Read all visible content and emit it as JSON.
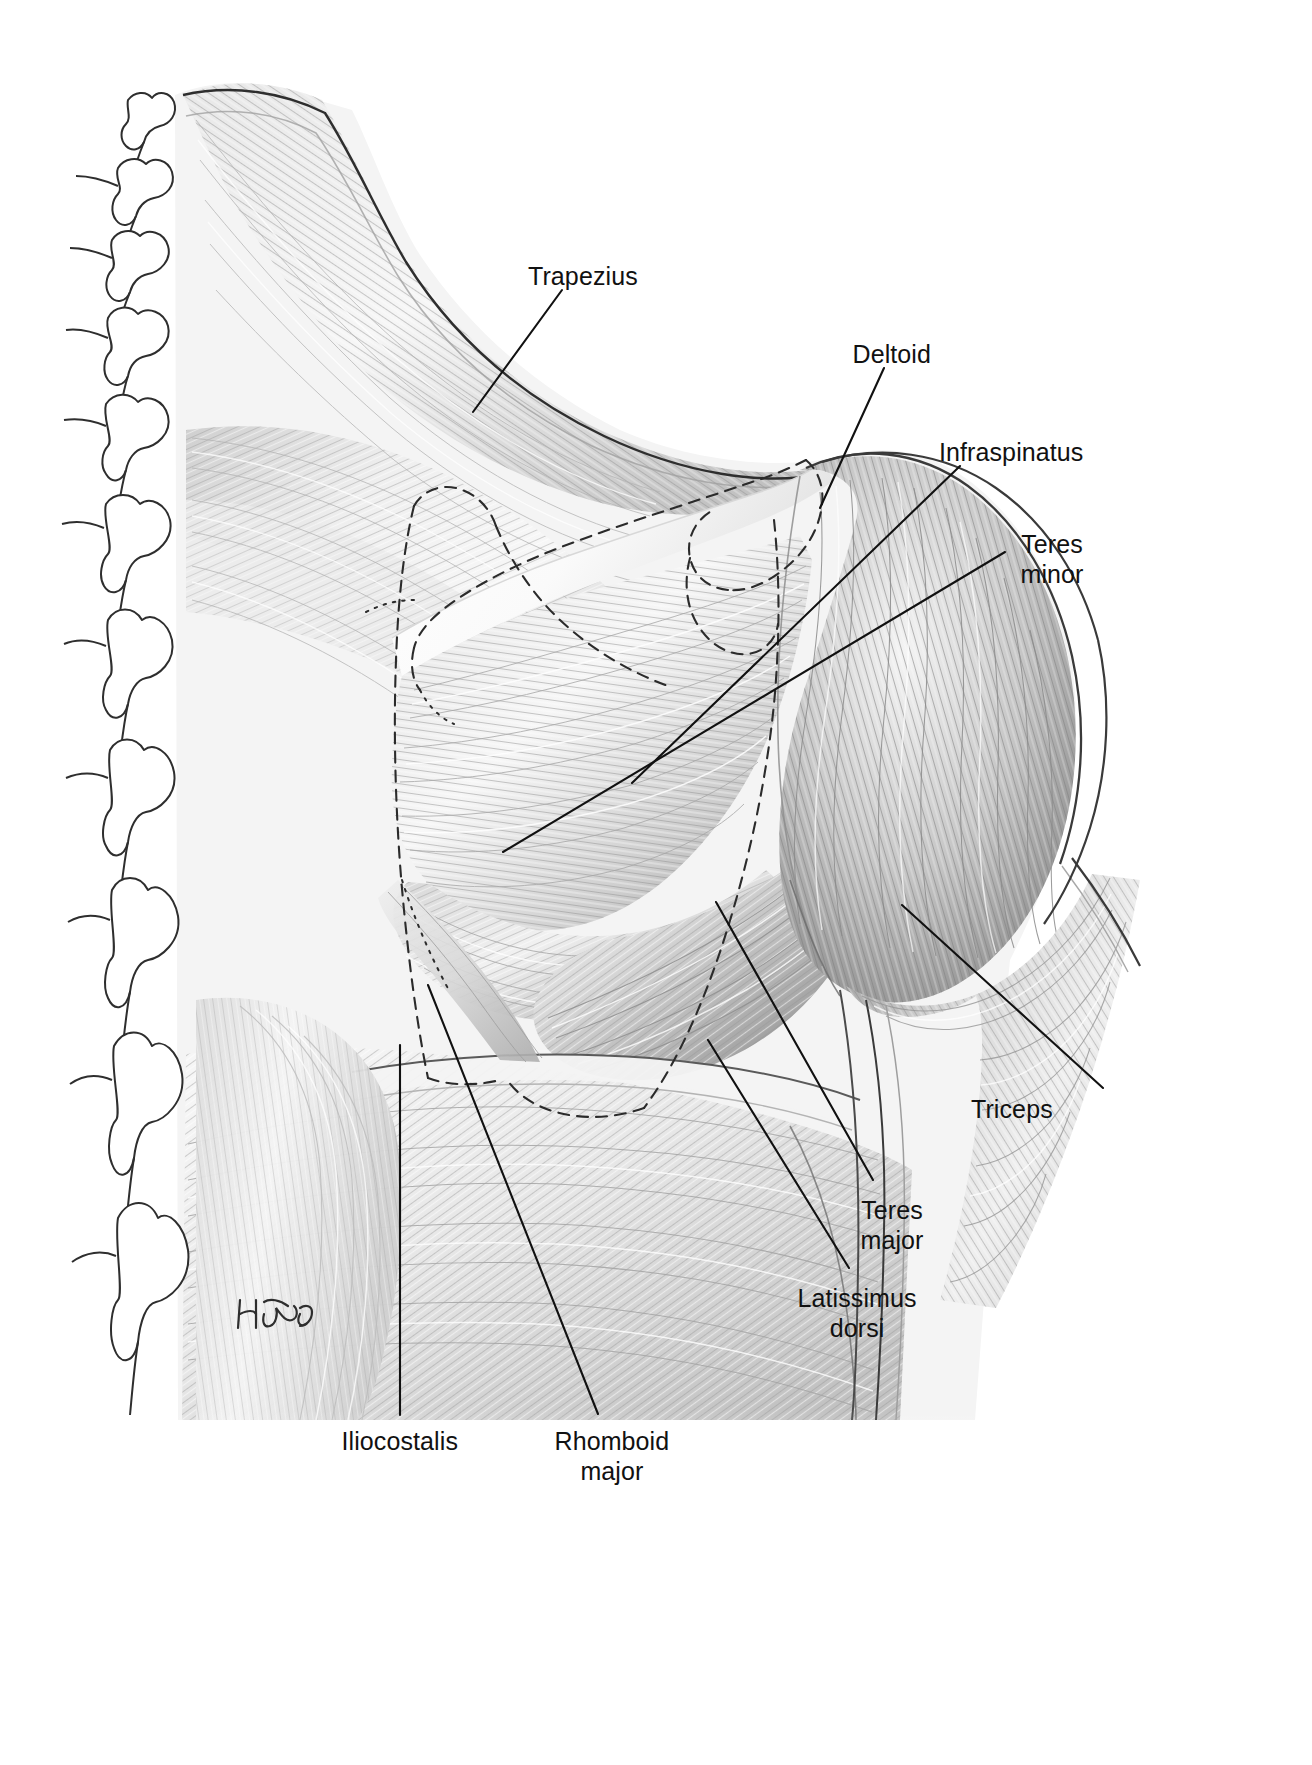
{
  "figure": {
    "artist_signature": "H.Thomas",
    "background_color": "#ffffff",
    "line_color": "#111111",
    "muscle_tone_light": "#f2f2f2",
    "muscle_tone_mid": "#c9c9c9",
    "muscle_tone_dark": "#8d8d8d",
    "muscle_tone_deepest": "#6a6a6a"
  },
  "labels": [
    {
      "id": "trapezius",
      "text": "Trapezius",
      "lines": [
        "Trapezius"
      ],
      "align": "center",
      "x": 583,
      "y": 262,
      "leader": {
        "x1": 562,
        "y1": 290,
        "x2": 473,
        "y2": 412
      }
    },
    {
      "id": "deltoid",
      "text": "Deltoid",
      "lines": [
        "Deltoid"
      ],
      "align": "center",
      "x": 892,
      "y": 340,
      "leader": {
        "x1": 884,
        "y1": 368,
        "x2": 820,
        "y2": 508
      }
    },
    {
      "id": "infraspinatus",
      "text": "Infraspinatus",
      "lines": [
        "Infraspinatus"
      ],
      "align": "center",
      "x": 1011,
      "y": 438,
      "leader": {
        "x1": 960,
        "y1": 466,
        "x2": 632,
        "y2": 783
      }
    },
    {
      "id": "teres-minor",
      "text": "Teres minor",
      "lines": [
        "Teres",
        "minor"
      ],
      "align": "center",
      "x": 1052,
      "y": 530,
      "leader": {
        "x1": 1005,
        "y1": 552,
        "x2": 503,
        "y2": 852
      }
    },
    {
      "id": "triceps",
      "text": "Triceps",
      "lines": [
        "Triceps"
      ],
      "align": "center",
      "x": 1012,
      "y": 1095,
      "leader": {
        "x1": 1103,
        "y1": 1088,
        "x2": 902,
        "y2": 905
      }
    },
    {
      "id": "teres-major",
      "text": "Teres major",
      "lines": [
        "Teres",
        "major"
      ],
      "align": "center",
      "x": 892,
      "y": 1196,
      "leader": {
        "x1": 873,
        "y1": 1180,
        "x2": 716,
        "y2": 902
      }
    },
    {
      "id": "latissimus-dorsi",
      "text": "Latissimus dorsi",
      "lines": [
        "Latissimus",
        "dorsi"
      ],
      "align": "center",
      "x": 857,
      "y": 1284,
      "leader": {
        "x1": 849,
        "y1": 1268,
        "x2": 708,
        "y2": 1040
      }
    },
    {
      "id": "iliocostalis",
      "text": "Iliocostalis",
      "lines": [
        "Iliocostalis"
      ],
      "align": "center",
      "x": 400,
      "y": 1427,
      "leader": {
        "x1": 400,
        "y1": 1415,
        "x2": 400,
        "y2": 1045
      }
    },
    {
      "id": "rhomboid-major",
      "text": "Rhomboid major",
      "lines": [
        "Rhomboid",
        "major"
      ],
      "align": "center",
      "x": 612,
      "y": 1427,
      "leader": {
        "x1": 598,
        "y1": 1414,
        "x2": 428,
        "y2": 985
      }
    }
  ],
  "anatomy": {
    "regions": [
      {
        "id": "vertebral-column",
        "name": "Vertebral column spinous processes"
      },
      {
        "id": "trapezius-region",
        "name": "Trapezius muscle body"
      },
      {
        "id": "deltoid-region",
        "name": "Deltoid muscle body"
      },
      {
        "id": "infraspinatus-region",
        "name": "Infraspinatus muscle body"
      },
      {
        "id": "teres-minor-region",
        "name": "Teres minor muscle body"
      },
      {
        "id": "teres-major-region",
        "name": "Teres major muscle body"
      },
      {
        "id": "latissimus-dorsi-region",
        "name": "Latissimus dorsi muscle body"
      },
      {
        "id": "triceps-region",
        "name": "Triceps brachii muscle body"
      },
      {
        "id": "iliocostalis-region",
        "name": "Iliocostalis muscle body"
      },
      {
        "id": "rhomboid-major-region",
        "name": "Rhomboid major muscle body"
      },
      {
        "id": "scapula-outline",
        "name": "Scapula dashed outline overlay"
      }
    ]
  }
}
